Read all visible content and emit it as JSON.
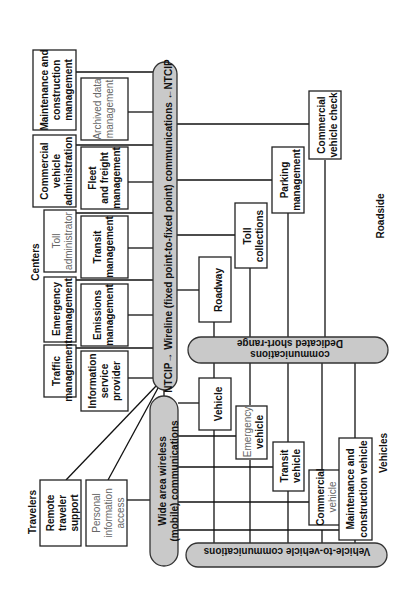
{
  "groups": {
    "centers": "Centers",
    "travelers": "Travelers",
    "roadside": "Roadside",
    "vehicles": "Vehicles"
  },
  "communications": {
    "wireline": "NTCIP→ Wireline (fixed point-to-fixed point) communications ←NTCIP",
    "wide_area_wireless": [
      "Wide area wireless",
      "(mobile) communications"
    ],
    "dsrc": [
      "Dedicated short-range",
      "communications"
    ],
    "v2v": "Vehicle-to-vehicle communications"
  },
  "centers": {
    "maintenance_construction_mgmt": [
      "Maintenance and",
      "construction",
      "management"
    ],
    "commercial_vehicle_admin": [
      "Commercial",
      "vehicle",
      "administration"
    ],
    "toll_admin": [
      "Toll",
      "administrator"
    ],
    "emergency_mgmt": [
      "Emergency",
      "management"
    ],
    "traffic_mgmt": [
      "Traffic",
      "management"
    ],
    "archived_data_mgmt": [
      "Archived data",
      "management"
    ],
    "fleet_freight_mgmt": [
      "Fleet",
      "and freight",
      "management"
    ],
    "transit_mgmt": [
      "Transit",
      "management"
    ],
    "emissions_mgmt": [
      "Emissions",
      "management"
    ],
    "info_service_provider": [
      "Information",
      "service",
      "provider"
    ]
  },
  "travelers": {
    "remote_traveler_support": [
      "Remote",
      "traveler",
      "support"
    ],
    "personal_info_access": [
      "Personal",
      "information",
      "access"
    ]
  },
  "roadside": {
    "roadway": "Roadway",
    "toll_collections": [
      "Toll",
      "collections"
    ],
    "parking_mgmt": [
      "Parking",
      "management"
    ],
    "commercial_vehicle_check": [
      "Commercial",
      "vehicle check"
    ]
  },
  "vehicles": {
    "vehicle": "Vehicle",
    "emergency_vehicle": [
      "Emergency",
      "vehicle"
    ],
    "transit_vehicle": [
      "Transit",
      "vehicle"
    ],
    "commercial_vehicle": [
      "Commercial",
      "vehicle"
    ],
    "maintenance_construction_vehicle": [
      "Maintenance and",
      "construction vehicle"
    ]
  }
}
